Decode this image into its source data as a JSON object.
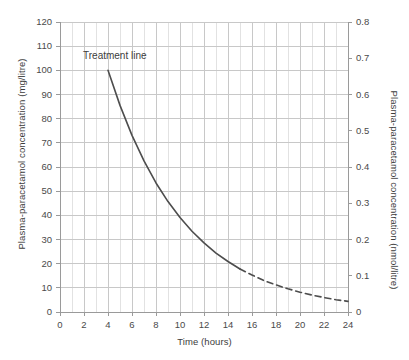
{
  "chart_data": {
    "type": "line",
    "title": "",
    "xlabel": "Time (hours)",
    "ylabel": "Plasma-paracetamol concentration (mg/litre)",
    "ylabel_right": "Plasma-paracetamol concentration (nmol/litre)",
    "xlim": [
      0,
      24
    ],
    "ylim": [
      0,
      120
    ],
    "ylim_right": [
      0,
      0.8
    ],
    "grid": true,
    "legend": "none",
    "xticks": [
      0,
      2,
      4,
      6,
      8,
      10,
      12,
      14,
      16,
      18,
      20,
      22,
      24
    ],
    "xtick_labels": [
      "0",
      "2",
      "4",
      "6",
      "8",
      "10",
      "12",
      "14",
      "16",
      "18",
      "20",
      "22",
      "24"
    ],
    "yticks": [
      0,
      10,
      20,
      30,
      40,
      50,
      60,
      70,
      80,
      90,
      100,
      110,
      120
    ],
    "ytick_labels": [
      "0",
      "10",
      "20",
      "30",
      "40",
      "50",
      "60",
      "70",
      "80",
      "90",
      "100",
      "110",
      "120"
    ],
    "yticks_right": [
      0,
      0.1,
      0.2,
      0.3,
      0.4,
      0.5,
      0.6,
      0.7,
      0.8
    ],
    "ytick_labels_right": [
      "0",
      "0.1",
      "0.2",
      "0.3",
      "0.4",
      "0.5",
      "0.6",
      "0.7",
      "0.8"
    ],
    "minor_xticks": [
      1,
      3,
      5,
      7,
      9,
      11,
      13,
      15,
      17,
      19,
      21,
      23
    ],
    "annotations": [
      {
        "text": "Treatment line",
        "x": 4.9,
        "y": 107
      }
    ],
    "series": [
      {
        "name": "Treatment line",
        "style": "solid",
        "color": "#4d4d4d",
        "x": [
          4,
          5,
          6,
          7,
          8,
          9,
          10,
          11,
          12,
          13,
          14,
          15
        ],
        "y": [
          100,
          85.5,
          73.1,
          62.5,
          53.4,
          45.7,
          39.1,
          33.4,
          28.6,
          24.4,
          20.9,
          17.8
        ]
      },
      {
        "name": "Treatment line (extrapolated)",
        "style": "dashed",
        "color": "#4d4d4d",
        "x": [
          15,
          16,
          17,
          18,
          19,
          20,
          21,
          22,
          23,
          24
        ],
        "y": [
          17.8,
          15.3,
          13.0,
          11.2,
          9.6,
          8.2,
          7.0,
          6.0,
          5.1,
          4.4
        ]
      }
    ]
  },
  "colors": {
    "curve": "#4d4d4d",
    "grid_major": "#c8c8c8",
    "grid_minor": "#e2e2e2",
    "axis": "#9a9a9a",
    "text": "#3c3c3c",
    "background": "#ffffff"
  }
}
